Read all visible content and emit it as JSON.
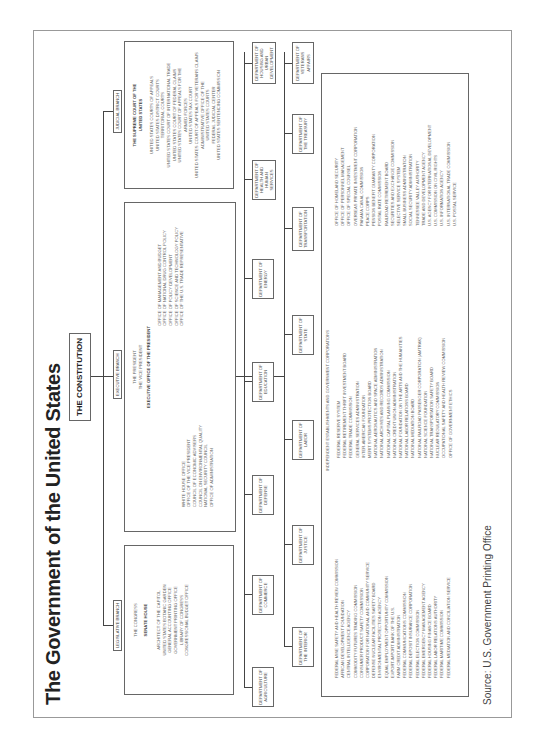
{
  "title": "The Government of the United States",
  "constitution": "THE CONSTITUTION",
  "legislative": {
    "label": "LEGISLATIVE BRANCH",
    "head": "THE CONGRESS",
    "chambers": "SENATE   HOUSE",
    "items": [
      "ARCHITECT OF THE CAPITOL",
      "UNITED STATES BOTANIC GARDEN",
      "GENERAL ACCOUNTING OFFICE",
      "GOVERNMENT PRINTING OFFICE",
      "LIBRARY OF CONGRESS",
      "CONGRESSIONAL BUDGET OFFICE"
    ]
  },
  "executive": {
    "label": "EXECUTIVE BRANCH",
    "president": "THE PRESIDENT",
    "vice_president": "THE VICE PRESIDENT",
    "eop": "EXECUTIVE OFFICE OF THE PRESIDENT",
    "left_items": [
      "WHITE HOUSE OFFICE",
      "OFFICE OF THE VICE PRESIDENT",
      "COUNCIL OF ECONOMIC ADVISERS",
      "COUNCIL ON ENVIRONMENTAL QUALITY",
      "NATIONAL SECURITY COUNCIL",
      "OFFICE OF ADMINISTRATION"
    ],
    "right_items": [
      "OFFICE OF MANAGEMENT AND BUDGET",
      "OFFICE OF NATIONAL DRUG CONTROL POLICY",
      "OFFICE OF POLICY DEVELOPMENT",
      "OFFICE OF SCIENCE AND TECHNOLOGY POLICY",
      "OFFICE OF THE U.S. TRADE REPRESENTATIVE"
    ]
  },
  "judicial": {
    "label": "JUDICIAL BRANCH",
    "head_line1": "THE SUPREME COURT OF THE",
    "head_line2": "UNITED STATES",
    "items": [
      "UNITED STATES COURTS OF APPEALS",
      "UNITED STATES DISTRICT COURTS",
      "TERRITORIAL COURTS",
      "UNITED STATES COURT OF INTERNATIONAL TRADE",
      "UNITED STATES COURT OF FEDERAL CLAIMS",
      "UNITED STATES COURT OF APPEALS FOR THE",
      "ARMED FORCES",
      "UNITED STATES TAX COURT",
      "UNITED STATES COURT OF APPEALS FOR VETERANS CLAIMS",
      "ADMINISTRATIVE OFFICE OF THE",
      "UNITED STATES COURTS",
      "FEDERAL JUDICIAL CENTER",
      "UNITED STATES SENTENCING COMMISSION"
    ]
  },
  "departments_row1": [
    {
      "line1": "DEPARTMENT OF",
      "line2": "AGRICULTURE",
      "line3": ""
    },
    {
      "line1": "DEPARTMENT OF",
      "line2": "COMMERCE",
      "line3": ""
    },
    {
      "line1": "DEPARTMENT OF",
      "line2": "DEFENSE",
      "line3": ""
    },
    {
      "line1": "DEPARTMENT OF",
      "line2": "EDUCATION",
      "line3": ""
    },
    {
      "line1": "DEPARTMENT OF",
      "line2": "ENERGY",
      "line3": ""
    },
    {
      "line1": "DEPARTMENT OF",
      "line2": "HEALTH AND HUMAN",
      "line3": "SERVICES"
    },
    {
      "line1": "DEPARTMENT OF",
      "line2": "HOUSING AND URBAN",
      "line3": "DEVELOPMENT"
    }
  ],
  "departments_row2": [
    {
      "line1": "DEPARTMENT OF",
      "line2": "THE INTERIOR",
      "line3": ""
    },
    {
      "line1": "DEPARTMENT OF",
      "line2": "JUSTICE",
      "line3": ""
    },
    {
      "line1": "DEPARTMENT OF",
      "line2": "LABOR",
      "line3": ""
    },
    {
      "line1": "DEPARTMENT OF",
      "line2": "STATE",
      "line3": ""
    },
    {
      "line1": "DEPARTMENT OF",
      "line2": "TRANSPORTATION",
      "line3": ""
    },
    {
      "line1": "DEPARTMENT OF",
      "line2": "THE TREASURY",
      "line3": ""
    },
    {
      "line1": "DEPARTMENT OF",
      "line2": "VETERANS AFFAIRS",
      "line3": ""
    }
  ],
  "independent": {
    "header": "INDEPENDENT ESTABLISHMENTS AND GOVERNMENT CORPORATIONS",
    "col1": [
      "FEDERAL MINE SAFETY AND HEALTH REVIEW COMMISSION",
      "AFRICAN DEVELOPMENT FOUNDATION",
      "CENTRAL INTELLIGENCE AGENCY",
      "COMMODITY FUTURES TRADING COMMISSION",
      "CONSUMER PRODUCT SAFETY COMMISSION",
      "CORPORATION FOR NATIONAL AND COMMUNITY SERVICE",
      "DEFENSE NUCLEAR FACILITIES SAFETY BOARD",
      "ENVIRONMENTAL PROTECTION AGENCY",
      "EQUAL EMPLOYMENT OPPORTUNITY COMMISSION",
      "EXPORT-IMPORT BANK OF THE U.S.",
      "FARM CREDIT ADMINISTRATION",
      "FEDERAL COMMUNICATIONS COMMISSION",
      "FEDERAL DEPOSIT INSURANCE CORPORATION",
      "FEDERAL ELECTION COMMISSION",
      "FEDERAL EMERGENCY MANAGEMENT AGENCY",
      "FEDERAL HOUSING FINANCE BOARD",
      "FEDERAL LABOR RELATIONS AUTHORITY",
      "FEDERAL MARITIME COMMISSION",
      "FEDERAL MEDIATION AND CONCILIATION SERVICE"
    ],
    "col2": [
      "FEDERAL RESERVE SYSTEM",
      "FEDERAL RETIREMENT THRIFT INVESTMENT BOARD",
      "FEDERAL TRADE COMMISSION",
      "GENERAL SERVICES ADMINISTRATION",
      "INTER-AMERICAN FOUNDATION",
      "MERIT SYSTEMS PROTECTION BOARD",
      "NATIONAL AERONAUTICS AND SPACE ADMINISTRATION",
      "NATIONAL ARCHIVES AND RECORDS ADMINISTRATION",
      "NATIONAL CAPITAL PLANNING COMMISSION",
      "NATIONAL CREDIT UNION ADMINISTRATION",
      "NATIONAL FOUNDATION ON THE ARTS AND THE HUMANITIES",
      "NATIONAL LABOR RELATIONS BOARD",
      "NATIONAL MEDIATION BOARD",
      "NATIONAL RAILROAD PASSENGER CORPORATION (AMTRAK)",
      "NATIONAL SCIENCE FOUNDATION",
      "NATIONAL TRANSPORTATION SAFETY BOARD",
      "NUCLEAR REGULATORY COMMISSION",
      "OCCUPATIONAL SAFETY AND HEALTH REVIEW COMMISSION",
      "OFFICE OF GOVERNMENT ETHICS"
    ],
    "col3": [
      "OFFICE OF HOMELAND SECURITY",
      "OFFICE OF PERSONNEL MANAGEMENT",
      "OFFICE OF SPECIAL COUNSEL",
      "OVERSEAS PRIVATE INVESTMENT CORPORATION",
      "PANAMA CANAL COMMISSION",
      "PEACE CORPS",
      "PENSION BENEFIT GUARANTY CORPORATION",
      "POSTAL RATE COMMISSION",
      "RAILROAD RETIREMENT BOARD",
      "SECURITIES AND EXCHANGE COMMISSION",
      "SELECTIVE SERVICE SYSTEM",
      "SMALL BUSINESS ADMINISTRATION",
      "SOCIAL SECURITY ADMINISTRATION",
      "TENNESSEE VALLEY AUTHORITY",
      "TRADE AND DEVELOPMENT AGENCY",
      "U.S. AGENCY FOR INTERNATIONAL DEVELOPMENT",
      "U.S. COMMISSION ON CIVIL RIGHTS",
      "U.S. INFORMATION AGENCY",
      "U.S. INTERNATIONAL TRADE COMMISSION",
      "U.S. POSTAL SERVICE"
    ]
  },
  "source": "Source: U.S. Government Printing Office"
}
